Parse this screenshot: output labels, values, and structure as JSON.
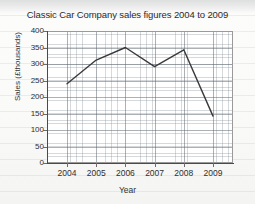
{
  "chart_data": {
    "type": "line",
    "title": "Classic Car Company sales figures 2004 to 2009",
    "xlabel": "Year",
    "ylabel": "Sales (£thousands)",
    "categories": [
      "2004",
      "2005",
      "2006",
      "2007",
      "2008",
      "2009"
    ],
    "x": [
      2004,
      2005,
      2006,
      2007,
      2008,
      2009
    ],
    "values": [
      240,
      312,
      350,
      292,
      343,
      142
    ],
    "series": [
      {
        "name": "Sales",
        "values": [
          240,
          312,
          350,
          292,
          343,
          142
        ]
      }
    ],
    "ylim": [
      0,
      400
    ],
    "ytick_values": [
      0,
      50,
      100,
      150,
      200,
      250,
      300,
      350,
      400
    ],
    "ytick_labels": [
      "0",
      "50",
      "100",
      "150",
      "200",
      "250",
      "300",
      "350",
      "400"
    ],
    "xtick_labels": [
      "2004",
      "2005",
      "2006",
      "2007",
      "2008",
      "2009"
    ],
    "grid": true,
    "grid_style": "graph-paper minor and major gridlines",
    "legend": false,
    "legend_position": "none",
    "line_color": "#3a3a3a",
    "markers": false,
    "background_color": "#ffffff",
    "page_background_color": "#f7f7f6"
  }
}
